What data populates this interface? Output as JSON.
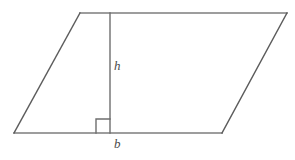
{
  "figure": {
    "name": "parallelogram-with-height",
    "background_color": "#ffffff",
    "width": 295,
    "height": 160,
    "stroke_color_horizontal": "#7d7d7d",
    "stroke_color_diagonal": "#5c5c5c",
    "stroke_color_height": "#6e6e6e",
    "stroke_color_right_angle": "#6e6e6e",
    "stroke_width": 1.4,
    "label_color": "#4a4a4a"
  },
  "labels": {
    "height_label": "h",
    "base_label": "b"
  },
  "geometry": {
    "vertices": {
      "top_left": {
        "x": 80,
        "y": 13
      },
      "top_right": {
        "x": 287,
        "y": 13
      },
      "bottom_right": {
        "x": 222,
        "y": 133
      },
      "bottom_left": {
        "x": 14,
        "y": 133
      }
    },
    "height_segment": {
      "x1": 110,
      "y1": 13,
      "x2": 110,
      "y2": 133
    },
    "right_angle_marker": {
      "size": 14,
      "corner_x": 110,
      "corner_y": 133,
      "orientation": "up-left"
    }
  }
}
